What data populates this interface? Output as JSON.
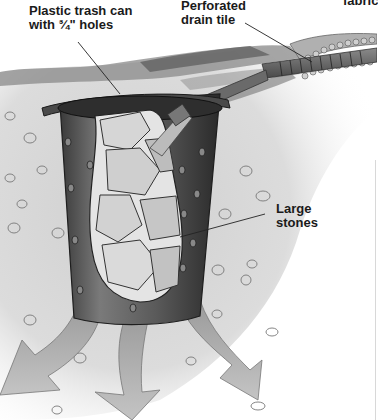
{
  "diagram": {
    "labels": {
      "trash_can_line1": "Plastic trash can",
      "trash_can_line2": "with ¾\" holes",
      "drain_tile_line1": "Perforated",
      "drain_tile_line2": "drain tile",
      "fabric": "fabric",
      "stones_line1": "Large",
      "stones_line2": "stones"
    },
    "components": [
      {
        "name": "trash-can",
        "label": "Plastic trash can with ¾\" holes"
      },
      {
        "name": "drain-tile",
        "label": "Perforated drain tile"
      },
      {
        "name": "landscape-fabric",
        "label": "fabric"
      },
      {
        "name": "large-stones",
        "label": "Large stones"
      },
      {
        "name": "water-flow-arrows",
        "label": ""
      }
    ],
    "colors": {
      "background": "#ffffff",
      "soil": "#d9d9d9",
      "can": "#555555",
      "can_dark": "#2e2e2e",
      "stones": "#c8c8c8",
      "arrows": "#bdbdbd",
      "text": "#1a1a1a"
    }
  }
}
